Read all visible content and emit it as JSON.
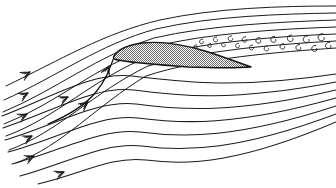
{
  "figure": {
    "background_color": "#ffffff",
    "ink_color": "#1b1b1b",
    "width": 336,
    "height": 188
  },
  "airfoil": {
    "label": "airfoil-section",
    "fill_pattern": "fine-checkerboard-hatch",
    "hatch_color": "#555555",
    "outline_color": "#141414",
    "leading_edge": [
      114,
      56
    ],
    "trailing_edge": [
      251,
      67
    ],
    "chord_px": 137,
    "angle_of_attack_note": "nose-up, chord inclined relative to oncoming flow",
    "outline_path": "M114,56 C118,49 128,45 142,43 C160,41 182,44 205,51 C224,57 240,63 251,67 C238,68 214,68 188,67 C162,65 136,63 124,61 C116,60 112,59 114,56 Z"
  },
  "streamlines": {
    "count_upper": 7,
    "count_lower": 8,
    "note": "incoming uniform flow from lower-left, deflected over and under the airfoil",
    "upper": [
      "M6,86 C60,60 104,33 160,20 C215,8 280,6 336,6",
      "M4,100 C58,76 100,44 156,29 C212,16 280,14 336,13",
      "M3,112 C56,90 98,55 154,38 C210,25 280,22 336,20",
      "M4,124 C56,104 96,66 152,47 C208,33 280,29 336,27",
      "M6,136 C56,118 94,78 150,56 C206,42 280,36 336,34",
      "M9,150 C58,132 94,92 148,66 C204,50 280,44 336,41",
      "M16,163 C62,146 96,106 146,76 C200,58 280,52 336,48"
    ],
    "lower": [
      "M2,116 C54,96 92,72 132,76 C176,81 230,90 336,74",
      "M3,128 C56,110 94,86 134,90 C178,96 232,102 336,82",
      "M5,140 C58,124 96,100 136,104 C180,110 234,114 336,90",
      "M8,152 C60,138 98,114 138,118 C182,124 236,126 336,98",
      "M12,164 C64,150 100,128 140,132 C184,138 238,138 336,106",
      "M20,176 C70,162 104,142 142,146 C186,152 240,150 336,114",
      "M38,184 C82,174 110,156 146,160 C190,166 242,162 336,122"
    ],
    "stagnation": "M48,124 C72,114 86,104 96,92 C106,80 110,68 114,57"
  },
  "arrows": {
    "label": "flow-direction-arrows",
    "style": "feathered-v-arrowhead",
    "markers": [
      {
        "x": 30,
        "y": 72,
        "angle": -29
      },
      {
        "x": 28,
        "y": 93,
        "angle": -28
      },
      {
        "x": 27,
        "y": 114,
        "angle": -27
      },
      {
        "x": 68,
        "y": 97,
        "angle": -24
      },
      {
        "x": 32,
        "y": 136,
        "angle": -26
      },
      {
        "x": 34,
        "y": 156,
        "angle": -24
      },
      {
        "x": 64,
        "y": 172,
        "angle": -22
      },
      {
        "x": 88,
        "y": 102,
        "angle": -38
      },
      {
        "x": 109,
        "y": 66,
        "angle": -66
      }
    ]
  },
  "wake": {
    "label": "turbulent-separated-wake",
    "description": "region of small rotating eddies shed downstream of the airfoil upper surface",
    "vortex_count": 19,
    "vortices": [
      {
        "cx": 202,
        "cy": 42,
        "r": 3.0
      },
      {
        "cx": 210,
        "cy": 46,
        "r": 2.6
      },
      {
        "cx": 216,
        "cy": 40,
        "r": 3.2
      },
      {
        "cx": 224,
        "cy": 45,
        "r": 2.8
      },
      {
        "cx": 231,
        "cy": 39,
        "r": 3.4
      },
      {
        "cx": 238,
        "cy": 46,
        "r": 3.0
      },
      {
        "cx": 245,
        "cy": 40,
        "r": 3.6
      },
      {
        "cx": 252,
        "cy": 48,
        "r": 3.2
      },
      {
        "cx": 259,
        "cy": 41,
        "r": 3.8
      },
      {
        "cx": 267,
        "cy": 49,
        "r": 3.4
      },
      {
        "cx": 274,
        "cy": 40,
        "r": 4.0
      },
      {
        "cx": 283,
        "cy": 47,
        "r": 3.6
      },
      {
        "cx": 291,
        "cy": 39,
        "r": 4.4
      },
      {
        "cx": 299,
        "cy": 48,
        "r": 3.8
      },
      {
        "cx": 307,
        "cy": 40,
        "r": 4.6
      },
      {
        "cx": 315,
        "cy": 49,
        "r": 4.0
      },
      {
        "cx": 322,
        "cy": 38,
        "r": 4.8
      },
      {
        "cx": 329,
        "cy": 46,
        "r": 4.2
      },
      {
        "cx": 196,
        "cy": 47,
        "r": 2.4
      }
    ]
  }
}
